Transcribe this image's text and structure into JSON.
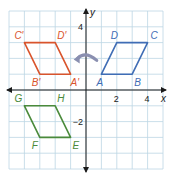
{
  "diagram": {
    "type": "coordinate-grid-reflection",
    "axes": {
      "x_label": "x",
      "y_label": "y",
      "x_range": [
        -5,
        5
      ],
      "y_range": [
        -5,
        5
      ],
      "x_ticks": [
        {
          "value": 2,
          "label": "2"
        },
        {
          "value": 4,
          "label": "4"
        }
      ],
      "y_ticks": [
        {
          "value": 4,
          "label": "4"
        },
        {
          "value": -2,
          "label": "−2"
        }
      ]
    },
    "colors": {
      "grid": "#bcd6e4",
      "axis": "#1a1a1a",
      "original": "#3f6db5",
      "reflection_y": "#d9542c",
      "third": "#4a8a3b",
      "arrow": "#8a8fb0"
    },
    "shapes": [
      {
        "name": "ABCD",
        "color_key": "original",
        "vertices": [
          {
            "label": "A",
            "x": 1,
            "y": 1,
            "dx": -5,
            "dy": 12
          },
          {
            "label": "B",
            "x": 3,
            "y": 1,
            "dx": 2,
            "dy": 12
          },
          {
            "label": "C",
            "x": 4,
            "y": 3,
            "dx": 3,
            "dy": -4
          },
          {
            "label": "D",
            "x": 2,
            "y": 3,
            "dx": -6,
            "dy": -4
          }
        ]
      },
      {
        "name": "A'B'C'D'",
        "color_key": "reflection_y",
        "vertices": [
          {
            "label": "A′",
            "x": -1,
            "y": 1,
            "dx": 0,
            "dy": 12
          },
          {
            "label": "B′",
            "x": -3,
            "y": 1,
            "dx": -8,
            "dy": 12
          },
          {
            "label": "C′",
            "x": -4,
            "y": 3,
            "dx": -10,
            "dy": -4
          },
          {
            "label": "D′",
            "x": -2,
            "y": 3,
            "dx": 2,
            "dy": -4
          }
        ]
      },
      {
        "name": "EFGH",
        "color_key": "third",
        "vertices": [
          {
            "label": "E",
            "x": -1,
            "y": -3,
            "dx": 2,
            "dy": 12
          },
          {
            "label": "F",
            "x": -3,
            "y": -3,
            "dx": -8,
            "dy": 12
          },
          {
            "label": "G",
            "x": -4,
            "y": -1,
            "dx": -10,
            "dy": -4
          },
          {
            "label": "H",
            "x": -2,
            "y": -1,
            "dx": 2,
            "dy": -4
          }
        ]
      }
    ],
    "arrow": {
      "description": "curved arrow pointing left across y-axis",
      "from_x": 0.7,
      "to_x": -0.8,
      "y": 2
    }
  }
}
